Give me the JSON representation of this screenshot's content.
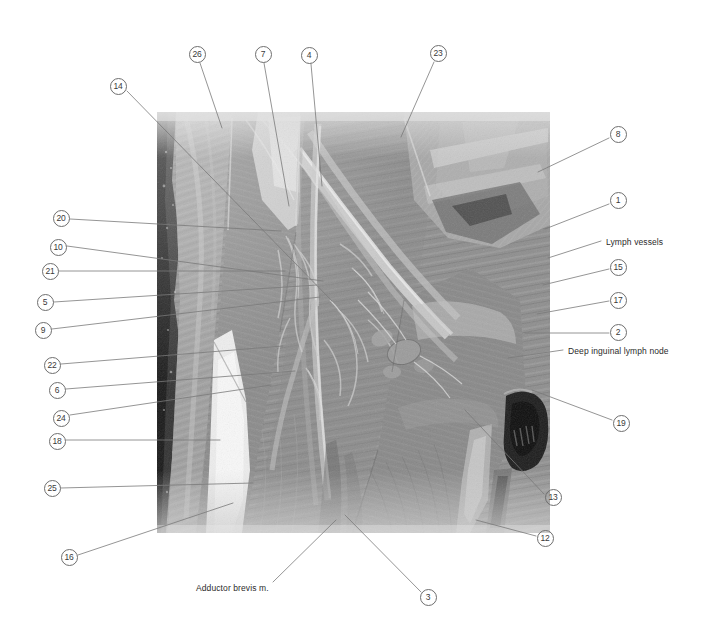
{
  "figure": {
    "kind": "anatomical-dissection-photograph",
    "region": "Deep inguinal / femoral triangle dissection",
    "photo": {
      "x": 157,
      "y": 112,
      "width": 393,
      "height": 421
    }
  },
  "text_labels": [
    {
      "id": "lymph-vessels",
      "text": "Lymph vessels",
      "x": 606,
      "y": 237,
      "anchor": "start",
      "leader": [
        [
          601,
          241
        ],
        [
          548,
          258
        ]
      ]
    },
    {
      "id": "deep-inguinal-lymph-node",
      "text": "Deep inguinal lymph node",
      "x": 568,
      "y": 346,
      "anchor": "start",
      "leader": [
        [
          563,
          350
        ],
        [
          508,
          358
        ]
      ]
    },
    {
      "id": "adductor-brevis",
      "text": "Adductor brevis m.",
      "x": 196,
      "y": 583,
      "anchor": "start",
      "leader": [
        [
          273,
          582
        ],
        [
          336,
          520
        ]
      ]
    }
  ],
  "numbered_callouts": [
    {
      "n": "26",
      "cx": 197,
      "cy": 54,
      "leader": [
        [
          200,
          63
        ],
        [
          222,
          128
        ]
      ]
    },
    {
      "n": "7",
      "cx": 263,
      "cy": 54,
      "leader": [
        [
          264,
          63
        ],
        [
          289,
          206
        ]
      ]
    },
    {
      "n": "4",
      "cx": 309,
      "cy": 55,
      "leader": [
        [
          311,
          64
        ],
        [
          322,
          186
        ]
      ]
    },
    {
      "n": "23",
      "cx": 438,
      "cy": 53,
      "leader": [
        [
          434,
          62
        ],
        [
          401,
          137
        ]
      ]
    },
    {
      "n": "14",
      "cx": 118,
      "cy": 86,
      "leader": [
        [
          127,
          91
        ],
        [
          332,
          301
        ]
      ]
    },
    {
      "n": "8",
      "cx": 618,
      "cy": 134,
      "leader": [
        [
          609,
          138
        ],
        [
          538,
          172
        ]
      ]
    },
    {
      "n": "1",
      "cx": 618,
      "cy": 200,
      "leader": [
        [
          609,
          204
        ],
        [
          545,
          229
        ]
      ]
    },
    {
      "n": "20",
      "cx": 61,
      "cy": 218,
      "leader": [
        [
          70,
          219
        ],
        [
          281,
          231
        ]
      ]
    },
    {
      "n": "10",
      "cx": 58,
      "cy": 247,
      "leader": [
        [
          67,
          246
        ],
        [
          323,
          281
        ]
      ]
    },
    {
      "n": "15",
      "cx": 618,
      "cy": 267,
      "leader": [
        [
          609,
          269
        ],
        [
          543,
          285
        ]
      ]
    },
    {
      "n": "21",
      "cx": 50,
      "cy": 271,
      "leader": [
        [
          59,
          271
        ],
        [
          285,
          271
        ]
      ]
    },
    {
      "n": "5",
      "cx": 45,
      "cy": 302,
      "leader": [
        [
          54,
          302
        ],
        [
          317,
          285
        ]
      ]
    },
    {
      "n": "17",
      "cx": 618,
      "cy": 300,
      "leader": [
        [
          609,
          301
        ],
        [
          537,
          314
        ]
      ]
    },
    {
      "n": "9",
      "cx": 43,
      "cy": 330,
      "leader": [
        [
          52,
          329
        ],
        [
          320,
          297
        ]
      ]
    },
    {
      "n": "2",
      "cx": 618,
      "cy": 332,
      "leader": [
        [
          609,
          333
        ],
        [
          525,
          333
        ]
      ]
    },
    {
      "n": "22",
      "cx": 52,
      "cy": 365,
      "leader": [
        [
          61,
          364
        ],
        [
          283,
          346
        ]
      ]
    },
    {
      "n": "6",
      "cx": 57,
      "cy": 390,
      "leader": [
        [
          66,
          389
        ],
        [
          295,
          371
        ]
      ]
    },
    {
      "n": "24",
      "cx": 61,
      "cy": 418,
      "leader": [
        [
          70,
          415
        ],
        [
          271,
          385
        ]
      ]
    },
    {
      "n": "19",
      "cx": 621,
      "cy": 423,
      "leader": [
        [
          612,
          420
        ],
        [
          532,
          390
        ]
      ]
    },
    {
      "n": "18",
      "cx": 57,
      "cy": 441,
      "leader": [
        [
          66,
          440
        ],
        [
          220,
          440
        ]
      ]
    },
    {
      "n": "25",
      "cx": 52,
      "cy": 488,
      "leader": [
        [
          61,
          488
        ],
        [
          253,
          483
        ]
      ]
    },
    {
      "n": "13",
      "cx": 553,
      "cy": 497,
      "leader": [
        [
          544,
          494
        ],
        [
          465,
          410
        ]
      ]
    },
    {
      "n": "12",
      "cx": 545,
      "cy": 538,
      "leader": [
        [
          536,
          536
        ],
        [
          476,
          520
        ]
      ]
    },
    {
      "n": "16",
      "cx": 69,
      "cy": 557,
      "leader": [
        [
          78,
          555
        ],
        [
          233,
          503
        ]
      ]
    },
    {
      "n": "3",
      "cx": 428,
      "cy": 597,
      "leader": [
        [
          421,
          592
        ],
        [
          345,
          515
        ]
      ]
    }
  ],
  "style": {
    "leader_color": "#7a7a7a",
    "circle_stroke": "#6e6e6e",
    "text_color": "#2b2b2b",
    "background": "#ffffff"
  }
}
